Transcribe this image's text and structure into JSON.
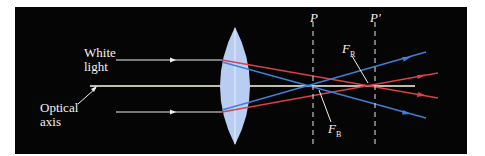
{
  "figure": {
    "labels": {
      "white_light": [
        "White",
        "light"
      ],
      "optical_axis": [
        "Optical",
        "axis"
      ],
      "plane_p": "P",
      "plane_p_prime": "P'",
      "focal_red": {
        "main": "F",
        "sub": "R"
      },
      "focal_blue": {
        "main": "F",
        "sub": "B"
      }
    },
    "colors": {
      "background": "#050505",
      "lens": "#b9cdf3",
      "red_ray": "#d8404a",
      "blue_ray": "#3f7fd6",
      "white_ray": "#f0f0f0",
      "axis": "#fffbe6"
    }
  }
}
